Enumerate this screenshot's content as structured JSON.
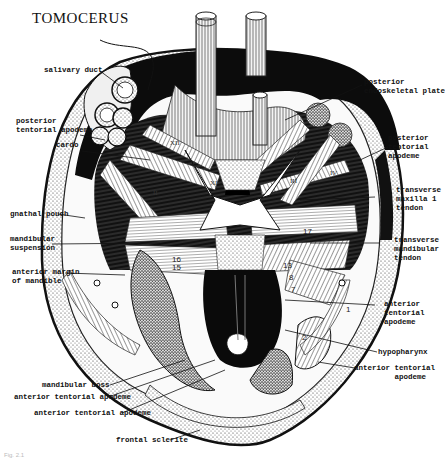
{
  "title": "TOMOCERUS",
  "labels": {
    "salivary_duct": "salivary duct",
    "posterior_endoskeletal_plate": "posterior\nendoskeletal plate",
    "posterior_tentorial_apodeme_left": "posterior\ntentorial apodeme",
    "posterior_tentorial_apodeme_right": "posterior\ntentorial\napodeme",
    "cardo": "cardo",
    "transverse_maxilla_1_tendon": "transverse\nmaxilla 1\ntendon",
    "gnathal_pouch": "gnathal pouch",
    "mandibular_suspension": "mandibular\nsuspension",
    "transverse_mandibular_tendon": "transverse\nmandibular\ntendon",
    "anterior_margin_of_mandible": "anterior margin\nof mandible",
    "anterior_tentorial_apodeme_right_upper": "anterior\ntentorial\napodeme",
    "hypopharynx": "hypopharynx",
    "anterior_tentorial_apodeme_right_lower": "anterior tentorial\n         apodeme",
    "mandibular_boss": "mandibular boss",
    "anterior_tentorial_apodeme_left_1": "anterior tentorial apodeme",
    "anterior_tentorial_apodeme_left_2": "anterior tentorial apodeme",
    "frontal_sclerite": "frontal sclerite"
  },
  "muscle_numbers": [
    "17",
    "16",
    "15",
    "13",
    "8",
    "7",
    "2",
    "1"
  ],
  "roman_numerals": [
    "XII",
    "XI",
    "II",
    "III",
    "IV",
    "VIII",
    "XIII"
  ],
  "caption": "Fig. 2.1"
}
